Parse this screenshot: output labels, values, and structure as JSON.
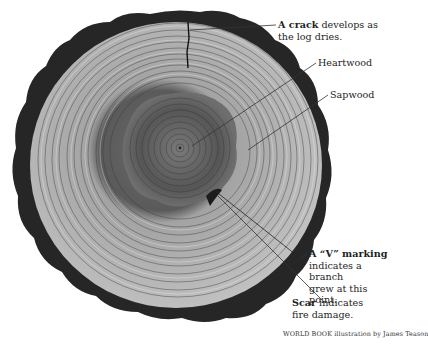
{
  "figure": {
    "labels": [
      {
        "id": "crack",
        "bold": "A crack",
        "rest_line1": " develops as",
        "line2": "the log dries."
      },
      {
        "id": "heartwood",
        "text": "Heartwood"
      },
      {
        "id": "sapwood",
        "text": "Sapwood"
      },
      {
        "id": "v-marking",
        "bold": "A “V” marking",
        "line2": "indicates a branch",
        "line3": "grew at this point."
      },
      {
        "id": "scar",
        "bold": "Scar",
        "rest_line1": " indicates",
        "line2": "fire damage."
      }
    ],
    "credit": {
      "brand": "World Book",
      "text": " illustration by James Teason"
    },
    "colors": {
      "bark": "#2a2a2a",
      "sapwood": "#b9b9b9",
      "heartwood": "#5a5a5a",
      "ring_line": "#3c3c3c",
      "background": "#ffffff"
    }
  }
}
